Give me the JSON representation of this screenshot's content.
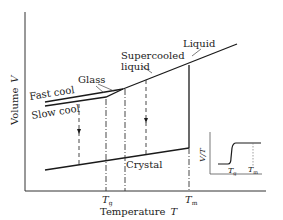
{
  "diagram": {
    "axes": {
      "xlabel": "Temperature",
      "xlabel_symbol": "T",
      "ylabel": "Volume",
      "ylabel_symbol": "V",
      "x_ticks": [
        {
          "label": "T",
          "sub": "g"
        },
        {
          "label": "T",
          "sub": "m"
        }
      ]
    },
    "labels": {
      "liquid": "Liquid",
      "supercooled_1": "Supercooled",
      "supercooled_2": "liquid",
      "glass": "Glass",
      "fast_cool": "Fast cool",
      "slow_cool": "Slow cool",
      "crystal": "Crystal"
    },
    "inset": {
      "ylabel": "V/T",
      "ticks": [
        {
          "label": "T",
          "sub": "g"
        },
        {
          "label": "T",
          "sub": "m"
        }
      ]
    },
    "colors": {
      "line": "#1a1a1a",
      "background": "#ffffff"
    }
  }
}
